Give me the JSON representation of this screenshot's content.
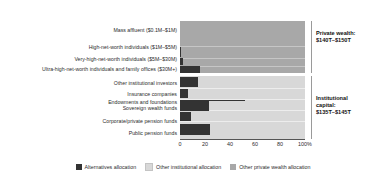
{
  "chart_data": {
    "type": "bar",
    "orientation": "horizontal",
    "title": "",
    "xlabel": "",
    "ylabel": "",
    "xlim": [
      0,
      100
    ],
    "xticks": [
      {
        "value": 0,
        "label": "0"
      },
      {
        "value": 20,
        "label": "20"
      },
      {
        "value": 40,
        "label": "40"
      },
      {
        "value": 60,
        "label": "60"
      },
      {
        "value": 80,
        "label": "80"
      },
      {
        "value": 100,
        "label": "100%"
      }
    ],
    "grid": false,
    "legend_position": "bottom",
    "legend": [
      {
        "name": "Alternatives allocation",
        "color": "#333333"
      },
      {
        "name": "Other institutional allocation",
        "color": "#d8d8d8"
      },
      {
        "name": "Other private wealth allocation",
        "color": "#a8a8a8"
      }
    ],
    "groups": [
      {
        "name": "Private wealth",
        "annotation": "Private wealth:\n$140T–$150T",
        "base_color": "#a8a8a8",
        "categories": [
          "Mass affluent ($0.1M–$1M)",
          "High-net-worth individuals ($1M–$5M)",
          "Very-high-net-worth individuals ($5M–$30M)",
          "Ultra-high-net-worth individuals and family offices ($30M+)"
        ],
        "values": [
          0,
          1,
          2,
          16
        ]
      },
      {
        "name": "Institutional capital",
        "annotation": "Institutional\ncapital:\n$135T–$145T",
        "base_color": "#d8d8d8",
        "categories": [
          "Other institutional investors",
          "Insurance companies",
          "Endowments and foundations",
          "Sovereign wealth funds",
          "Corporate/private pension funds",
          "Public pension funds"
        ],
        "values": [
          14,
          6,
          52,
          23,
          9,
          24
        ]
      }
    ]
  },
  "labels": {
    "r0": "Mass affluent ($0.1M–$1M)",
    "r1": "High-net-worth individuals ($1M–$5M)",
    "r2": "Very-high-net-worth individuals ($5M–$30M)",
    "r3": "Ultra-high-net-worth individuals and family offices ($30M+)",
    "r4": "Other institutional investors",
    "r5": "Insurance companies",
    "r6": "Endowments and foundations",
    "r7": "Sovereign wealth funds",
    "r8": "Corporate/private pension funds",
    "r9": "Public pension funds"
  },
  "annotations": {
    "private_wealth": "Private wealth:\n$140T–$150T",
    "institutional": "Institutional\ncapital:\n$135T–$145T"
  },
  "ticks": {
    "t0": "0",
    "t1": "20",
    "t2": "40",
    "t3": "60",
    "t4": "80",
    "t5": "100%"
  },
  "legend": {
    "l0": "Alternatives allocation",
    "l1": "Other institutional allocation",
    "l2": "Other private wealth allocation"
  }
}
